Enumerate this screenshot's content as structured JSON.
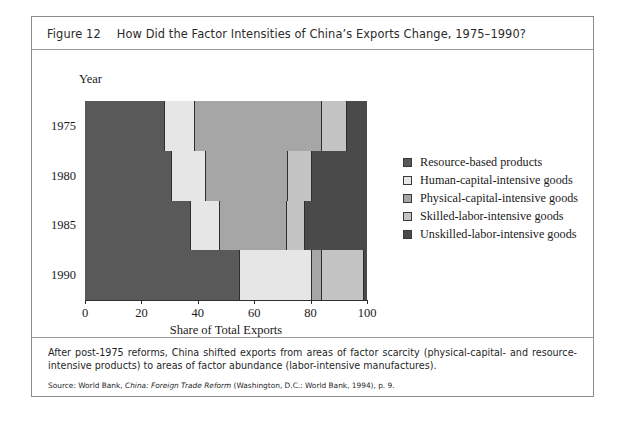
{
  "figure": {
    "number": "Figure 12",
    "title": "How Did the Factor Intensities of China’s Exports Change, 1975–1990?",
    "caption": "After post-1975 reforms, China shifted exports from areas of factor scarcity (physical-capital- and resource-intensive products) to areas of factor abundance (labor-intensive manufactures).",
    "source": {
      "prefix": "Source: World Bank, ",
      "italic_title": "China: Foreign Trade Reform",
      "suffix": " (Washington, D.C.: World Bank, 1994), p. 9."
    }
  },
  "colors": {
    "resource_based": "#595959",
    "human_capital": "#e6e6e6",
    "physical_capital": "#a6a6a6",
    "skilled_labor": "#c4c4c4",
    "unskilled_labor": "#4a4a4a",
    "frame_border": "#8a8a8a",
    "segment_border": "#2e2e2e",
    "text": "#1a1a1a"
  },
  "chart_data": {
    "type": "bar",
    "orientation": "horizontal",
    "stacked": true,
    "title": "How Did the Factor Intensities of China’s Exports Change, 1975–1990?",
    "xlabel": "Share of Total Exports",
    "ylabel": "Year",
    "xlim": [
      0,
      100
    ],
    "xticks": [
      0,
      20,
      40,
      60,
      80,
      100
    ],
    "grid": false,
    "legend_position": "right",
    "categories": [
      "1975",
      "1980",
      "1985",
      "1990"
    ],
    "series": [
      {
        "name": "Resource-based products",
        "color": "#595959",
        "values": [
          28.5,
          31.0,
          37.5,
          55.0
        ]
      },
      {
        "name": "Human-capital-intensive goods",
        "color": "#e6e6e6",
        "values": [
          10.5,
          12.0,
          10.5,
          25.5
        ]
      },
      {
        "name": "Physical-capital-intensive goods",
        "color": "#a6a6a6",
        "values": [
          45.0,
          29.0,
          23.5,
          3.5
        ]
      },
      {
        "name": "Skilled-labor-intensive goods",
        "color": "#c4c4c4",
        "values": [
          9.0,
          8.5,
          6.5,
          15.0
        ]
      },
      {
        "name": "Unskilled-labor-intensive goods",
        "color": "#4a4a4a",
        "values": [
          7.0,
          19.5,
          22.0,
          1.0
        ]
      }
    ]
  }
}
